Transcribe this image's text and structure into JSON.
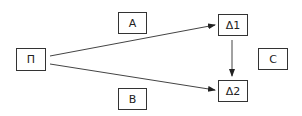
{
  "diagram": {
    "nodes": [
      {
        "id": "pi",
        "label": "Π"
      },
      {
        "id": "a",
        "label": "A"
      },
      {
        "id": "b",
        "label": "B"
      },
      {
        "id": "d1",
        "label": "Δ1"
      },
      {
        "id": "d2",
        "label": "Δ2"
      },
      {
        "id": "c",
        "label": "C"
      }
    ],
    "edges": [
      {
        "from": "pi",
        "to": "d1"
      },
      {
        "from": "pi",
        "to": "d2"
      },
      {
        "from": "d1",
        "to": "d2"
      }
    ],
    "colors": {
      "stroke": "#333333",
      "background": "#ffffff"
    }
  }
}
